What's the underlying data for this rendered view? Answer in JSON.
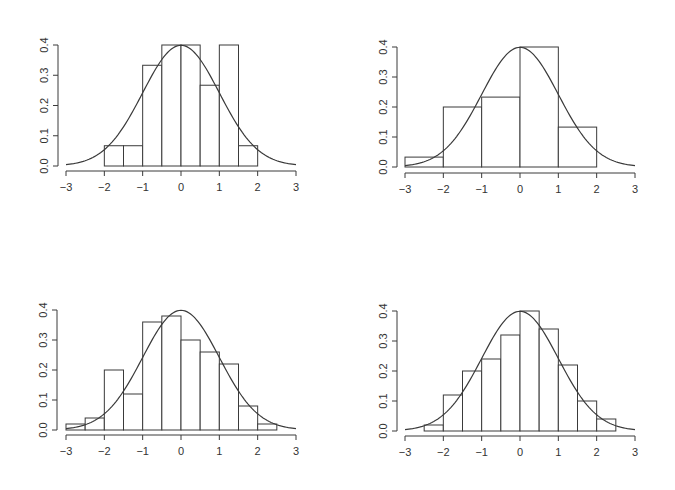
{
  "figure": {
    "width": 675,
    "height": 490,
    "background": "#ffffff",
    "line_color": "#3a3a3a"
  },
  "chart_data": [
    {
      "type": "bar",
      "subtype": "histogram_with_normal_density",
      "title": "",
      "xlabel": "",
      "ylabel": "",
      "xlim": [
        -3,
        3
      ],
      "ylim": [
        0,
        0.4
      ],
      "xticks": [
        "-3",
        "-2",
        "-1",
        "0",
        "1",
        "2",
        "3"
      ],
      "yticks": [
        "0.0",
        "0.1",
        "0.2",
        "0.3",
        "0.4"
      ],
      "bin_width": 0.5,
      "bins": [
        [
          -2,
          -1.5
        ],
        [
          -1.5,
          -1
        ],
        [
          -1,
          -0.5
        ],
        [
          -0.5,
          0
        ],
        [
          0,
          0.5
        ],
        [
          0.5,
          1
        ],
        [
          1,
          1.5
        ],
        [
          1.5,
          2
        ]
      ],
      "values": [
        0.067,
        0.067,
        0.333,
        0.4,
        0.4,
        0.267,
        0.4,
        0.067
      ],
      "curve": {
        "type": "normal_density",
        "mean": 0,
        "sd": 1,
        "range": [
          -3,
          3
        ]
      },
      "grid": false,
      "box": {
        "x0": 66,
        "x1": 296,
        "y0": 166,
        "y1": 45,
        "yaxis_x": 58,
        "xaxis_y": 171
      }
    },
    {
      "type": "bar",
      "subtype": "histogram_with_normal_density",
      "title": "",
      "xlabel": "",
      "ylabel": "",
      "xlim": [
        -3,
        3
      ],
      "ylim": [
        0,
        0.4
      ],
      "xticks": [
        "-3",
        "-2",
        "-1",
        "0",
        "1",
        "2",
        "3"
      ],
      "yticks": [
        "0.0",
        "0.1",
        "0.2",
        "0.3",
        "0.4"
      ],
      "bin_width": 1,
      "bins": [
        [
          -3,
          -2
        ],
        [
          -2,
          -1
        ],
        [
          -1,
          0
        ],
        [
          0,
          1
        ],
        [
          1,
          2
        ]
      ],
      "values": [
        0.033,
        0.2,
        0.233,
        0.4,
        0.133
      ],
      "curve": {
        "type": "normal_density",
        "mean": 0,
        "sd": 1,
        "range": [
          -3,
          3
        ]
      },
      "grid": false,
      "box": {
        "x0": 405,
        "x1": 635,
        "y0": 167,
        "y1": 47,
        "yaxis_x": 397,
        "xaxis_y": 173
      }
    },
    {
      "type": "bar",
      "subtype": "histogram_with_normal_density",
      "title": "",
      "xlabel": "",
      "ylabel": "",
      "xlim": [
        -3,
        3
      ],
      "ylim": [
        0,
        0.4
      ],
      "xticks": [
        "-3",
        "-2",
        "-1",
        "0",
        "1",
        "2",
        "3"
      ],
      "yticks": [
        "0.0",
        "0.1",
        "0.2",
        "0.3",
        "0.4"
      ],
      "bin_width": 0.5,
      "bins": [
        [
          -3,
          -2.5
        ],
        [
          -2.5,
          -2
        ],
        [
          -2,
          -1.5
        ],
        [
          -1.5,
          -1
        ],
        [
          -1,
          -0.5
        ],
        [
          -0.5,
          0
        ],
        [
          0,
          0.5
        ],
        [
          0.5,
          1
        ],
        [
          1,
          1.5
        ],
        [
          1.5,
          2
        ],
        [
          2,
          2.5
        ]
      ],
      "values": [
        0.02,
        0.04,
        0.2,
        0.12,
        0.36,
        0.38,
        0.3,
        0.26,
        0.22,
        0.08,
        0.02
      ],
      "curve": {
        "type": "normal_density",
        "mean": 0,
        "sd": 1,
        "range": [
          -3,
          3
        ]
      },
      "grid": false,
      "box": {
        "x0": 66,
        "x1": 296,
        "y0": 430,
        "y1": 310,
        "yaxis_x": 57,
        "xaxis_y": 435
      }
    },
    {
      "type": "bar",
      "subtype": "histogram_with_normal_density",
      "title": "",
      "xlabel": "",
      "ylabel": "",
      "xlim": [
        -3,
        3
      ],
      "ylim": [
        0,
        0.4
      ],
      "xticks": [
        "-3",
        "-2",
        "-1",
        "0",
        "1",
        "2",
        "3"
      ],
      "yticks": [
        "0.0",
        "0.1",
        "0.2",
        "0.3",
        "0.4"
      ],
      "bin_width": 0.5,
      "bins": [
        [
          -2.5,
          -2
        ],
        [
          -2,
          -1.5
        ],
        [
          -1.5,
          -1
        ],
        [
          -1,
          -0.5
        ],
        [
          -0.5,
          0
        ],
        [
          0,
          0.5
        ],
        [
          0.5,
          1
        ],
        [
          1,
          1.5
        ],
        [
          1.5,
          2
        ],
        [
          2,
          2.5
        ]
      ],
      "values": [
        0.02,
        0.12,
        0.2,
        0.24,
        0.32,
        0.4,
        0.34,
        0.22,
        0.1,
        0.04
      ],
      "curve": {
        "type": "normal_density",
        "mean": 0,
        "sd": 1,
        "range": [
          -3,
          3
        ]
      },
      "grid": false,
      "box": {
        "x0": 405,
        "x1": 635,
        "y0": 431,
        "y1": 311,
        "yaxis_x": 397,
        "xaxis_y": 436
      }
    }
  ]
}
